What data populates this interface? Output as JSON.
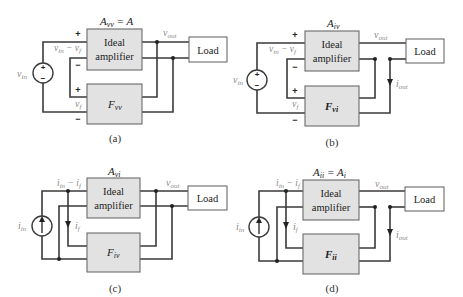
{
  "figure": {
    "panels": [
      {
        "id": "a",
        "caption": "(a)",
        "gain_label": "A",
        "gain_sub": "vv",
        "gain_suffix": " = A",
        "amplifier_line1": "Ideal",
        "amplifier_line2": "amplifier",
        "feedback_label": "F",
        "feedback_sub": "vv",
        "load_label": "Load",
        "source_type": "voltage",
        "source_label": "v",
        "source_sub": "in",
        "error_label": "v",
        "error_sub1": "in",
        "error_mid": " − v",
        "error_sub2": "f",
        "feedback_signal": "v",
        "feedback_signal_sub": "f",
        "output_label": "v",
        "output_sub": "out",
        "plus": "+",
        "minus": "−"
      },
      {
        "id": "b",
        "caption": "(b)",
        "gain_label": "A",
        "gain_sub": "iv",
        "gain_suffix": "",
        "amplifier_line1": "Ideal",
        "amplifier_line2": "amplifier",
        "feedback_label": "F",
        "feedback_sub": "vi",
        "load_label": "Load",
        "source_type": "voltage",
        "source_label": "v",
        "source_sub": "in",
        "error_label": "v",
        "error_sub1": "in",
        "error_mid": " − v",
        "error_sub2": "f",
        "feedback_signal": "v",
        "feedback_signal_sub": "f",
        "output_label": "v",
        "output_sub": "out",
        "output_current": "i",
        "output_current_sub": "out",
        "plus": "+",
        "minus": "−"
      },
      {
        "id": "c",
        "caption": "(c)",
        "gain_label": "A",
        "gain_sub": "vi",
        "gain_suffix": "",
        "amplifier_line1": "Ideal",
        "amplifier_line2": "amplifier",
        "feedback_label": "F",
        "feedback_sub": "iv",
        "load_label": "Load",
        "source_type": "current",
        "source_label": "i",
        "source_sub": "in",
        "error_label": "i",
        "error_sub1": "in",
        "error_mid": " − i",
        "error_sub2": "f",
        "feedback_signal": "i",
        "feedback_signal_sub": "f",
        "output_label": "v",
        "output_sub": "out"
      },
      {
        "id": "d",
        "caption": "(d)",
        "gain_label": "A",
        "gain_sub": "ii",
        "gain_suffix": " = A",
        "gain_suffix_sub": "i",
        "amplifier_line1": "Ideal",
        "amplifier_line2": "amplifier",
        "feedback_label": "F",
        "feedback_sub": "ii",
        "load_label": "Load",
        "source_type": "current",
        "source_label": "i",
        "source_sub": "in",
        "error_label": "i",
        "error_sub1": "in",
        "error_mid": " − i",
        "error_sub2": "f",
        "feedback_signal": "i",
        "feedback_signal_sub": "f",
        "output_label": "v",
        "output_sub": "out",
        "output_current": "i",
        "output_current_sub": "out"
      }
    ],
    "colors": {
      "wire": "#3a3a3a",
      "box_fill": "#e2e2e2",
      "box_stroke": "#6a6a6a",
      "signal_label": "#8a8a8a",
      "text": "#222222"
    }
  }
}
